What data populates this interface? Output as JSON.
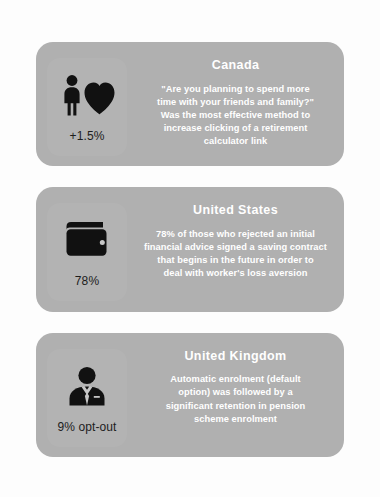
{
  "page": {
    "background_color": "#fdfdfd",
    "card_color": "#b0b0b0",
    "title_color": "#ffffff",
    "body_text_color": "#ffffff",
    "stat_text_color": "#1d1d1d",
    "icon_color": "#111111"
  },
  "cards": [
    {
      "id": "canada",
      "country": "Canada",
      "icon_name": "person-and-heart-icon",
      "stat": "+1.5%",
      "description": "\"Are you planning to spend more\ntime with your friends and family?\"\nWas the most effective method to\nincrease clicking of a retirement\ncalculator link"
    },
    {
      "id": "united-states",
      "country": "United States",
      "icon_name": "wallet-icon",
      "stat": "78%",
      "description": "78% of those who rejected an initial\nfinancial advice signed a saving contract\nthat begins in the future in order to\ndeal with worker's loss aversion"
    },
    {
      "id": "united-kingdom",
      "country": "United Kingdom",
      "icon_name": "businessman-icon",
      "stat": "9% opt-out",
      "description": "Automatic enrolment  (default\noption) was followed by a\nsignificant retention in pension\nscheme enrolment"
    }
  ]
}
